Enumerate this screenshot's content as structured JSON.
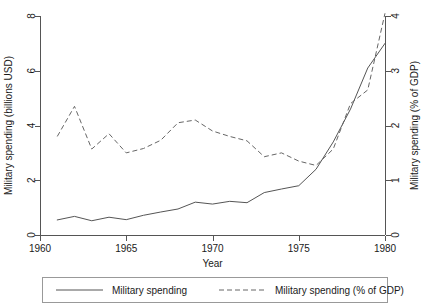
{
  "chart_data": {
    "type": "line",
    "title": "",
    "subtitle": "",
    "xlabel": "Year",
    "ylabel": "Military spending (billions USD)",
    "y2label": "Military spending (% of GDP)",
    "xlim": [
      1960,
      1980
    ],
    "ylim": [
      0,
      8
    ],
    "y2lim": [
      0,
      4
    ],
    "xticks": [
      "1960",
      "1965",
      "1970",
      "1975",
      "1980"
    ],
    "xtick_values": [
      1960,
      1965,
      1970,
      1975,
      1980
    ],
    "yticks": [
      "0",
      "2",
      "4",
      "6",
      "8"
    ],
    "ytick_values": [
      0,
      2,
      4,
      6,
      8
    ],
    "y2ticks": [
      "0",
      "1",
      "2",
      "3",
      "4"
    ],
    "y2tick_values": [
      0,
      1,
      2,
      3,
      4
    ],
    "grid": false,
    "legend_position": "bottom",
    "x": [
      1961,
      1962,
      1963,
      1964,
      1965,
      1966,
      1967,
      1968,
      1969,
      1970,
      1971,
      1972,
      1973,
      1974,
      1975,
      1976,
      1977,
      1978,
      1979,
      1980
    ],
    "series": [
      {
        "name": "Military spending",
        "axis": "left",
        "style": "solid",
        "color": "#555555",
        "units": "billions USD",
        "values": [
          0.55,
          0.68,
          0.52,
          0.65,
          0.56,
          0.72,
          0.84,
          0.95,
          1.2,
          1.13,
          1.23,
          1.18,
          1.55,
          1.68,
          1.8,
          2.4,
          3.4,
          4.6,
          6.1,
          7.0
        ]
      },
      {
        "name": "Military spending (% of GDP)",
        "axis": "right",
        "style": "dashed",
        "color": "#666666",
        "units": "% of GDP",
        "values": [
          1.8,
          2.35,
          1.57,
          1.85,
          1.5,
          1.58,
          1.73,
          2.05,
          2.1,
          1.9,
          1.8,
          1.72,
          1.43,
          1.5,
          1.35,
          1.27,
          1.57,
          2.4,
          2.65,
          4.05
        ]
      }
    ],
    "legend": [
      {
        "label": "Military spending",
        "style": "solid"
      },
      {
        "label": "Military spending (% of GDP)",
        "style": "dashed"
      }
    ]
  },
  "geometry": {
    "plot_left": 40,
    "plot_right": 385,
    "plot_top": 16,
    "plot_bottom": 235
  }
}
